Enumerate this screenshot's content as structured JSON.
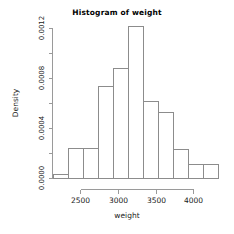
{
  "chart_data": {
    "type": "bar",
    "title": "Histogram of weight",
    "xlabel": "weight",
    "ylabel": "Density",
    "grid": false,
    "legend": null,
    "xlim": [
      2150,
      4400
    ],
    "ylim": [
      0.0,
      0.00125
    ],
    "bin_width": 200,
    "bin_edges": [
      2200,
      2400,
      2600,
      2800,
      3000,
      3200,
      3400,
      3600,
      3800,
      4000,
      4200,
      4400
    ],
    "categories": [
      "2200-2400",
      "2400-2600",
      "2600-2800",
      "2800-3000",
      "3000-3200",
      "3200-3400",
      "3400-3600",
      "3600-3800",
      "3800-4000",
      "4000-4200",
      "4200-4400"
    ],
    "values": [
      3e-05,
      0.00024,
      0.00024,
      0.00074,
      0.00088,
      0.00122,
      0.00062,
      0.00053,
      0.00023,
      0.00011,
      0.00011
    ],
    "xticks": [
      2500,
      3000,
      3500,
      4000
    ],
    "xtick_labels": [
      "2500",
      "3000",
      "3500",
      "4000"
    ],
    "yticks": [
      0.0,
      0.0002,
      0.0004,
      0.0006,
      0.0008,
      0.001,
      0.0012
    ],
    "ytick_labels": [
      "0.0000",
      "",
      "0.0004",
      "",
      "0.0008",
      "",
      "0.0012"
    ],
    "ytick_labels_major": [
      "0.0000",
      "0.0004",
      "0.0008",
      "0.0012"
    ],
    "axis_color": "#9a9a9a",
    "bar_edge_color": "#8c8c8c",
    "bar_fill_color": "#ffffff",
    "background_color": "#ffffff"
  }
}
